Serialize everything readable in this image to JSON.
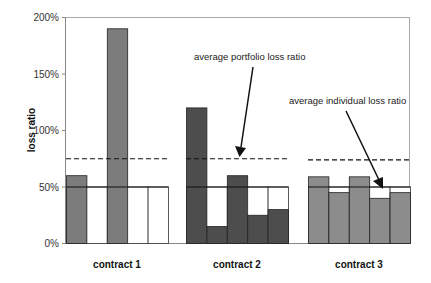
{
  "chart_data": {
    "type": "bar",
    "title": "",
    "xlabel": "",
    "ylabel": "loss ratio",
    "ylim": [
      0,
      200
    ],
    "yticks": [
      "0%",
      "50%",
      "100%",
      "150%",
      "200%"
    ],
    "grid": false,
    "legend": null,
    "categories": [
      "contract 1",
      "contract 2",
      "contract 3"
    ],
    "groups": [
      {
        "name": "contract 1",
        "color": "#7c7c7c",
        "values": [
          60,
          0,
          190,
          0,
          0
        ],
        "average_individual_loss_ratio": 50,
        "average_portfolio_loss_ratio": 75
      },
      {
        "name": "contract 2",
        "color": "#4d4d4d",
        "values": [
          120,
          15,
          60,
          25,
          30
        ],
        "average_individual_loss_ratio": 50,
        "average_portfolio_loss_ratio": 75
      },
      {
        "name": "contract 3",
        "color": "#8c8c8c",
        "values": [
          59,
          45,
          59,
          40,
          45
        ],
        "average_individual_loss_ratio": 50,
        "average_portfolio_loss_ratio": 74
      }
    ],
    "annotations": [
      {
        "text": "average portfolio loss ratio",
        "points_to": "dashed line, contract 2"
      },
      {
        "text": "average individual loss ratio",
        "points_to": "solid line, contract 3"
      }
    ]
  },
  "labels": {
    "ylabel": "loss ratio",
    "yticks": [
      "0%",
      "50%",
      "100%",
      "150%",
      "200%"
    ],
    "categories": [
      "contract 1",
      "contract 2",
      "contract 3"
    ],
    "annotation_portfolio": "average portfolio loss ratio",
    "annotation_individual": "average individual loss ratio"
  }
}
